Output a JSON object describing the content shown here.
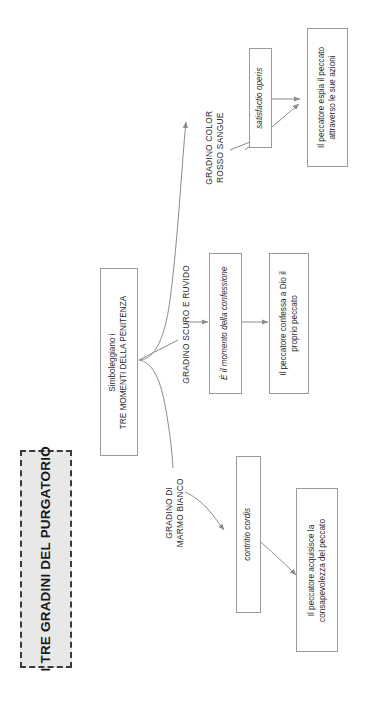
{
  "diagram": {
    "title": "I TRE GRADINI DEL PURGATORIO",
    "orientation": "rotated-90-ccw",
    "root": {
      "line1": "Simboleggiano i",
      "line2": "TRE MOMENTI DELLA PENITENZA"
    },
    "branches": [
      {
        "id": "marmo-bianco",
        "step_label_line1": "GRADINO DI",
        "step_label_line2": "MARMO BIANCO",
        "latin_term": "contritio cordis",
        "outcome_line1": "Il peccatore acquisisce la",
        "outcome_line2": "consapevolezza del peccato"
      },
      {
        "id": "scuro-ruvido",
        "step_label_line1": "GRADINO SCURO E RUVIDO",
        "step_label_line2": "",
        "latin_term": "È il momento della confessione",
        "outcome_line1": "Il peccatore confessa a Dio il",
        "outcome_line2": "proprio peccato"
      },
      {
        "id": "rosso-sangue",
        "step_label_line1": "GRADINO COLOR",
        "step_label_line2": "ROSSO SANGUE",
        "latin_term": "satisfactio operis",
        "outcome_line1": "Il peccatore espia il peccato",
        "outcome_line2": "attraverso le sue azioni"
      }
    ],
    "colors": {
      "title_fill": "#e8e8e8",
      "title_border": "#3a3a3a",
      "box_border": "#9a9a9a",
      "connector": "#8c8c8c",
      "text": "#2b2b2b"
    }
  }
}
